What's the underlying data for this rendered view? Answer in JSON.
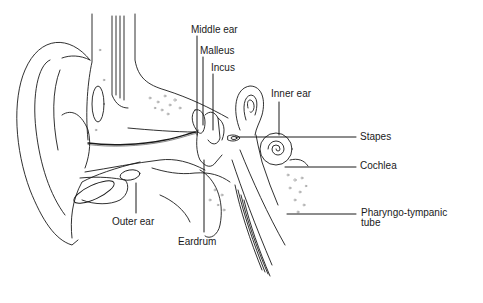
{
  "diagram": {
    "colors": {
      "line": "#1a1a1a",
      "stipple": "#8a8a8a",
      "background": "#ffffff"
    },
    "labels": {
      "middle_ear": "Middle ear",
      "malleus": "Malleus",
      "incus": "Incus",
      "inner_ear": "Inner ear",
      "stapes": "Stapes",
      "cochlea": "Cochlea",
      "pharyngo_tympanic_line1": "Pharyngo-tympanic",
      "pharyngo_tympanic_line2": "tube",
      "outer_ear": "Outer ear",
      "eardrum": "Eardrum"
    }
  }
}
